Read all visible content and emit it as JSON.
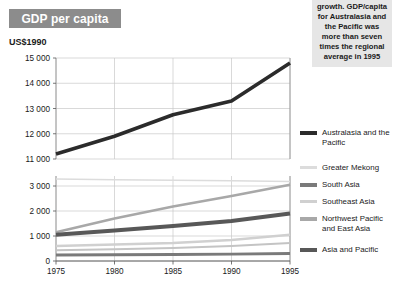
{
  "title": {
    "chip_label": "GDP per capita"
  },
  "units": {
    "label": "US$1990"
  },
  "annotation": {
    "text": "growth. GDP/capita for Australasia and the Pacific was more than seven times the regional average in 1995"
  },
  "legend": {
    "items": [
      {
        "label": "Australasia and the Pacific",
        "color": "#2b2b2b",
        "thickness": 4
      },
      {
        "label": "Greater Mekong",
        "color": "#dcdcdc",
        "thickness": 3
      },
      {
        "label": "South Asia",
        "color": "#7a7a7a",
        "thickness": 3.5
      },
      {
        "label": "Southeast Asia",
        "color": "#d0d0d0",
        "thickness": 3
      },
      {
        "label": "Northwest Pacific and East Asia",
        "color": "#a8a8a8",
        "thickness": 3.5
      },
      {
        "label": "Asia and Pacific",
        "color": "#585858",
        "thickness": 4
      }
    ]
  },
  "chart_data": {
    "type": "line",
    "title": "GDP per capita",
    "xlabel": "",
    "ylabel": "US$1990",
    "x": [
      1975,
      1980,
      1985,
      1990,
      1995
    ],
    "xlim": [
      1975,
      1995
    ],
    "xticks": [
      "1975",
      "1980",
      "1985",
      "1990",
      "1995"
    ],
    "grid": true,
    "legend_position": "right",
    "broken_axis": true,
    "panels": [
      {
        "name": "upper",
        "ylim": [
          11000,
          15000
        ],
        "yticks": [
          "11 000",
          "12 000",
          "13 000",
          "14 000",
          "15 000"
        ],
        "ytick_values": [
          11000,
          12000,
          13000,
          14000,
          15000
        ],
        "series": [
          {
            "name": "Australasia and the Pacific",
            "color": "#2b2b2b",
            "thickness": 3.6,
            "values": [
              11200,
              11900,
              12750,
              13300,
              14800
            ]
          }
        ]
      },
      {
        "name": "lower",
        "ylim": [
          0,
          3400
        ],
        "yticks": [
          "0",
          "1 000",
          "2 000",
          "3 000"
        ],
        "ytick_values": [
          0,
          1000,
          2000,
          3000
        ],
        "series": [
          {
            "name": "Greater Mekong",
            "color": "#dcdcdc",
            "thickness": 1.6,
            "values": [
              3280,
              3250,
              3230,
              3210,
              3180
            ]
          },
          {
            "name": "Northwest Pacific and East Asia",
            "color": "#a8a8a8",
            "thickness": 2.6,
            "values": [
              1150,
              1700,
              2180,
              2600,
              3050
            ]
          },
          {
            "name": "Asia and Pacific",
            "color": "#585858",
            "thickness": 4.2,
            "values": [
              1050,
              1220,
              1400,
              1600,
              1900
            ]
          },
          {
            "name": "Southeast Asia",
            "color": "#d0d0d0",
            "thickness": 2.4,
            "values": [
              600,
              660,
              720,
              840,
              1050
            ]
          },
          {
            "name": "South Asia",
            "color": "#c4c4c4",
            "thickness": 2.2,
            "values": [
              430,
              470,
              520,
              600,
              720
            ]
          },
          {
            "name": "South Asia lower",
            "color": "#7a7a7a",
            "thickness": 3.0,
            "values": [
              240,
              250,
              262,
              275,
              300
            ]
          }
        ]
      }
    ]
  }
}
